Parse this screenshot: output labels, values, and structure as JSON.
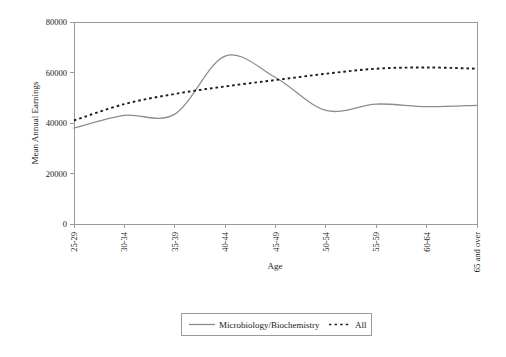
{
  "chart_data": {
    "type": "line",
    "title": "",
    "xlabel": "Age",
    "ylabel": "Mean Annual Earnings",
    "categories": [
      "25-29",
      "30-34",
      "35-39",
      "40-44",
      "45-49",
      "50-54",
      "55-59",
      "60-64",
      "65 and over"
    ],
    "ylim": [
      0,
      80000
    ],
    "ytick_labels": [
      "0",
      "20000",
      "40000",
      "60000",
      "80000"
    ],
    "ytick_values": [
      0,
      20000,
      40000,
      60000,
      80000
    ],
    "grid": false,
    "legend_position": "bottom-center",
    "series": [
      {
        "name": "Microbiology/Biochemistry",
        "style": "solid",
        "color": "#8d8d8d",
        "values": [
          38000,
          43000,
          43500,
          66500,
          58000,
          45000,
          47500,
          46500,
          47000
        ]
      },
      {
        "name": "All",
        "style": "dotted",
        "color": "#1a1a1a",
        "values": [
          41000,
          47500,
          51500,
          54500,
          57000,
          59500,
          61500,
          62000,
          61500
        ]
      }
    ]
  },
  "legend": {
    "entries": [
      {
        "label": "Microbiology/Biochemistry"
      },
      {
        "label": "All"
      }
    ]
  }
}
